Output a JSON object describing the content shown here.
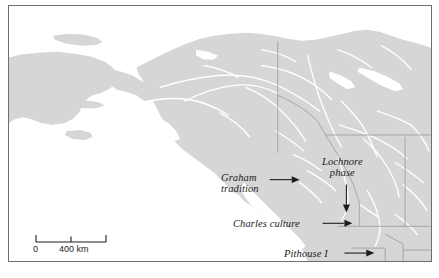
{
  "figure": {
    "kind": "reference-map",
    "region": "Northwestern North America",
    "frame_color": "#6e6e6e",
    "land_color": "#d6d6d6",
    "water_color": "#ffffff",
    "river_color": "#ffffff",
    "border_color": "#a9a9a9",
    "label_color": "#1c1c1c"
  },
  "annotations": [
    {
      "id": "graham-tradition",
      "name": "Graham tradition",
      "line1": "Graham",
      "line2": "tradition",
      "arrow": "right",
      "label_left": 228,
      "label_top": 168
    },
    {
      "id": "lochnore-phase",
      "name": "Lochnore phase",
      "line1": "Lochnore",
      "line2": "phase",
      "arrow": "down",
      "label_left": 325,
      "label_top": 152
    },
    {
      "id": "charles-culture",
      "name": "Charles culture",
      "line1": "Charles culture",
      "line2": "",
      "arrow": "right",
      "label_left": 240,
      "label_top": 213
    },
    {
      "id": "pithouse-i",
      "name": "Pithouse I",
      "line1": "Pithouse I",
      "line2": "",
      "arrow": "right",
      "label_left": 291,
      "label_top": 243
    }
  ],
  "scalebar": {
    "zero_label": "0",
    "max_label": "400 km",
    "units": "km",
    "min_value": 0,
    "mid_value": 200,
    "max_value": 400,
    "tick_count": 3
  }
}
